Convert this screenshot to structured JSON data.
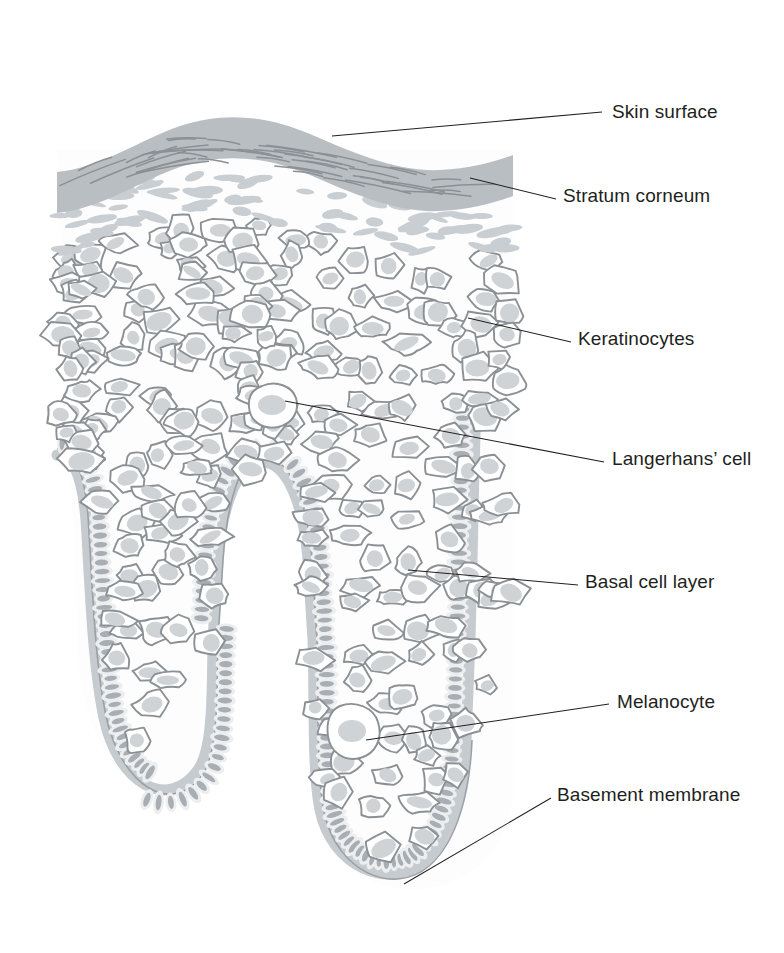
{
  "figure": {
    "background_color": "#ffffff",
    "line_color": "#231f20",
    "cell_outline_color": "#8b9095",
    "nucleus_color": "#cfd3d6",
    "basal_nucleus_color": "#a8aeb3",
    "basement_membrane_color": "#c6cbcf",
    "stratum_corneum_color": "#b9bec3"
  },
  "labels": [
    {
      "id": "skin-surface",
      "text": "Skin surface",
      "x": 612,
      "y": 118
    },
    {
      "id": "stratum-corneum",
      "text": "Stratum corneum",
      "x": 563,
      "y": 202
    },
    {
      "id": "keratinocytes",
      "text": "Keratinocytes",
      "x": 578,
      "y": 345
    },
    {
      "id": "langerhans-cell",
      "text": "Langerhans’ cell",
      "x": 612,
      "y": 465
    },
    {
      "id": "basal-cell-layer",
      "text": "Basal cell layer",
      "x": 585,
      "y": 588
    },
    {
      "id": "melanocyte",
      "text": "Melanocyte",
      "x": 617,
      "y": 708
    },
    {
      "id": "basement-membrane",
      "text": "Basement membrane",
      "x": 557,
      "y": 801
    }
  ],
  "leaders": [
    {
      "id": "leader-skin-surface",
      "path": "M 332,136 L 602,112"
    },
    {
      "id": "leader-stratum-corneum",
      "path": "M 470,178 L 556,199"
    },
    {
      "id": "leader-keratinocytes",
      "path": "M 468,318 L 571,342"
    },
    {
      "id": "leader-langerhans-cell",
      "path": "M 285,401 L 604,462"
    },
    {
      "id": "leader-basal-cell-layer",
      "path": "M 408,570 L 578,585"
    },
    {
      "id": "leader-melanocyte",
      "path": "M 366,740 L 609,704"
    },
    {
      "id": "leader-basement-membrane",
      "path": "M 404,884 L 551,798"
    }
  ],
  "structures": [
    {
      "id": "skin-surface",
      "name": "Skin surface"
    },
    {
      "id": "stratum-corneum",
      "name": "Stratum corneum"
    },
    {
      "id": "granular-layer",
      "name": "Granular layer"
    },
    {
      "id": "keratinocyte-layer",
      "name": "Keratinocytes"
    },
    {
      "id": "langerhans-cell",
      "name": "Langerhans' cell"
    },
    {
      "id": "basal-cell-layer",
      "name": "Basal cell layer"
    },
    {
      "id": "melanocyte",
      "name": "Melanocyte"
    },
    {
      "id": "basement-membrane",
      "name": "Basement membrane"
    },
    {
      "id": "rete-ridge-left",
      "name": "Left rete ridge"
    },
    {
      "id": "rete-ridge-right",
      "name": "Right rete ridge"
    },
    {
      "id": "dermal-papilla",
      "name": "Dermal papilla"
    }
  ]
}
